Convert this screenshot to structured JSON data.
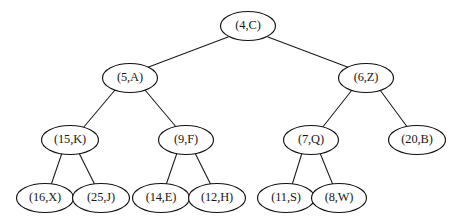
{
  "figure": {
    "kind": "binary-tree-diagram",
    "background_color": "#ffffff",
    "stroke_color": "#111111",
    "text_color": "#171717"
  },
  "tree": {
    "nodes": [
      {
        "id": "n0",
        "label": "(4,C)",
        "key": 4,
        "value": "C",
        "level": 0,
        "cx": 248,
        "cy": 26,
        "rx": 27.5,
        "ry": 14.5
      },
      {
        "id": "n1",
        "label": "(5,A)",
        "key": 5,
        "value": "A",
        "level": 1,
        "cx": 130,
        "cy": 78,
        "rx": 27.5,
        "ry": 14.5
      },
      {
        "id": "n2",
        "label": "(6,Z)",
        "key": 6,
        "value": "Z",
        "level": 1,
        "cx": 366,
        "cy": 78,
        "rx": 27.5,
        "ry": 14.5
      },
      {
        "id": "n3",
        "label": "(15,K)",
        "key": 15,
        "value": "K",
        "level": 2,
        "cx": 70,
        "cy": 140,
        "rx": 28.5,
        "ry": 14.5
      },
      {
        "id": "n4",
        "label": "(9,F)",
        "key": 9,
        "value": "F",
        "level": 2,
        "cx": 186,
        "cy": 140,
        "rx": 27.5,
        "ry": 14.5
      },
      {
        "id": "n5",
        "label": "(7,Q)",
        "key": 7,
        "value": "Q",
        "level": 2,
        "cx": 311,
        "cy": 140,
        "rx": 27.5,
        "ry": 14.5
      },
      {
        "id": "n6",
        "label": "(20,B)",
        "key": 20,
        "value": "B",
        "level": 2,
        "cx": 417,
        "cy": 140,
        "rx": 28.5,
        "ry": 14.5
      },
      {
        "id": "n7",
        "label": "(16,X)",
        "key": 16,
        "value": "X",
        "level": 3,
        "cx": 45,
        "cy": 198,
        "rx": 28.5,
        "ry": 14.5
      },
      {
        "id": "n8",
        "label": "(25,J)",
        "key": 25,
        "value": "J",
        "level": 3,
        "cx": 101,
        "cy": 198,
        "rx": 28.5,
        "ry": 14.5
      },
      {
        "id": "n9",
        "label": "(14,E)",
        "key": 14,
        "value": "E",
        "level": 3,
        "cx": 161,
        "cy": 198,
        "rx": 28.5,
        "ry": 14.5
      },
      {
        "id": "n10",
        "label": "(12,H)",
        "key": 12,
        "value": "H",
        "level": 3,
        "cx": 217,
        "cy": 198,
        "rx": 28.5,
        "ry": 14.5
      },
      {
        "id": "n11",
        "label": "(11,S)",
        "key": 11,
        "value": "S",
        "level": 3,
        "cx": 286,
        "cy": 198,
        "rx": 28.5,
        "ry": 14.5
      },
      {
        "id": "n12",
        "label": "(8,W)",
        "key": 8,
        "value": "W",
        "level": 3,
        "cx": 339,
        "cy": 198,
        "rx": 27.5,
        "ry": 14.5
      }
    ],
    "edges": [
      {
        "id": "e0",
        "from": "n0",
        "to": "n1",
        "x1": 228,
        "y1": 37,
        "x2": 146,
        "y2": 68
      },
      {
        "id": "e1",
        "from": "n0",
        "to": "n2",
        "x1": 268,
        "y1": 37,
        "x2": 350,
        "y2": 68
      },
      {
        "id": "e2",
        "from": "n1",
        "to": "n3",
        "x1": 115,
        "y1": 90,
        "x2": 83,
        "y2": 128
      },
      {
        "id": "e3",
        "from": "n1",
        "to": "n4",
        "x1": 145,
        "y1": 90,
        "x2": 177,
        "y2": 128
      },
      {
        "id": "e4",
        "from": "n2",
        "to": "n5",
        "x1": 352,
        "y1": 90,
        "x2": 322,
        "y2": 128
      },
      {
        "id": "e5",
        "from": "n2",
        "to": "n6",
        "x1": 380,
        "y1": 90,
        "x2": 408,
        "y2": 128
      },
      {
        "id": "e6",
        "from": "n3",
        "to": "n7",
        "x1": 62,
        "y1": 153,
        "x2": 51,
        "y2": 185
      },
      {
        "id": "e7",
        "from": "n3",
        "to": "n8",
        "x1": 79,
        "y1": 153,
        "x2": 95,
        "y2": 185
      },
      {
        "id": "e8",
        "from": "n4",
        "to": "n9",
        "x1": 177,
        "y1": 153,
        "x2": 166,
        "y2": 185
      },
      {
        "id": "e9",
        "from": "n4",
        "to": "n10",
        "x1": 195,
        "y1": 153,
        "x2": 211,
        "y2": 185
      },
      {
        "id": "e10",
        "from": "n5",
        "to": "n11",
        "x1": 302,
        "y1": 153,
        "x2": 292,
        "y2": 185
      },
      {
        "id": "e11",
        "from": "n5",
        "to": "n12",
        "x1": 320,
        "y1": 153,
        "x2": 333,
        "y2": 185
      }
    ]
  }
}
